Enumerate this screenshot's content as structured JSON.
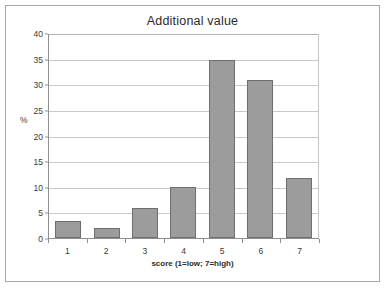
{
  "chart_data": {
    "type": "bar",
    "title": "Additional value",
    "xlabel": "score (1=low; 7=high)",
    "ylabel": "%",
    "categories": [
      "1",
      "2",
      "3",
      "4",
      "5",
      "6",
      "7"
    ],
    "values": [
      3.3,
      1.9,
      5.9,
      10,
      35,
      31,
      11.8
    ],
    "ylim": [
      0,
      40
    ],
    "ytick_step": 5,
    "yticks": [
      "40",
      "35",
      "30",
      "25",
      "20",
      "15",
      "10",
      "5",
      "0"
    ],
    "ytick_values": [
      40,
      35,
      30,
      25,
      20,
      15,
      10,
      5,
      0
    ],
    "grid": true,
    "grid_axis": "y",
    "legend": false,
    "legend_position": "none",
    "bar_color": "#9c9c9c",
    "bar_border_color": "#6e6e6e",
    "gridline_color": "#c9c9c9",
    "axis_color": "#8f8f8f",
    "plot_background": "#ffffff",
    "frame_border_color": "#a8a8a8"
  }
}
